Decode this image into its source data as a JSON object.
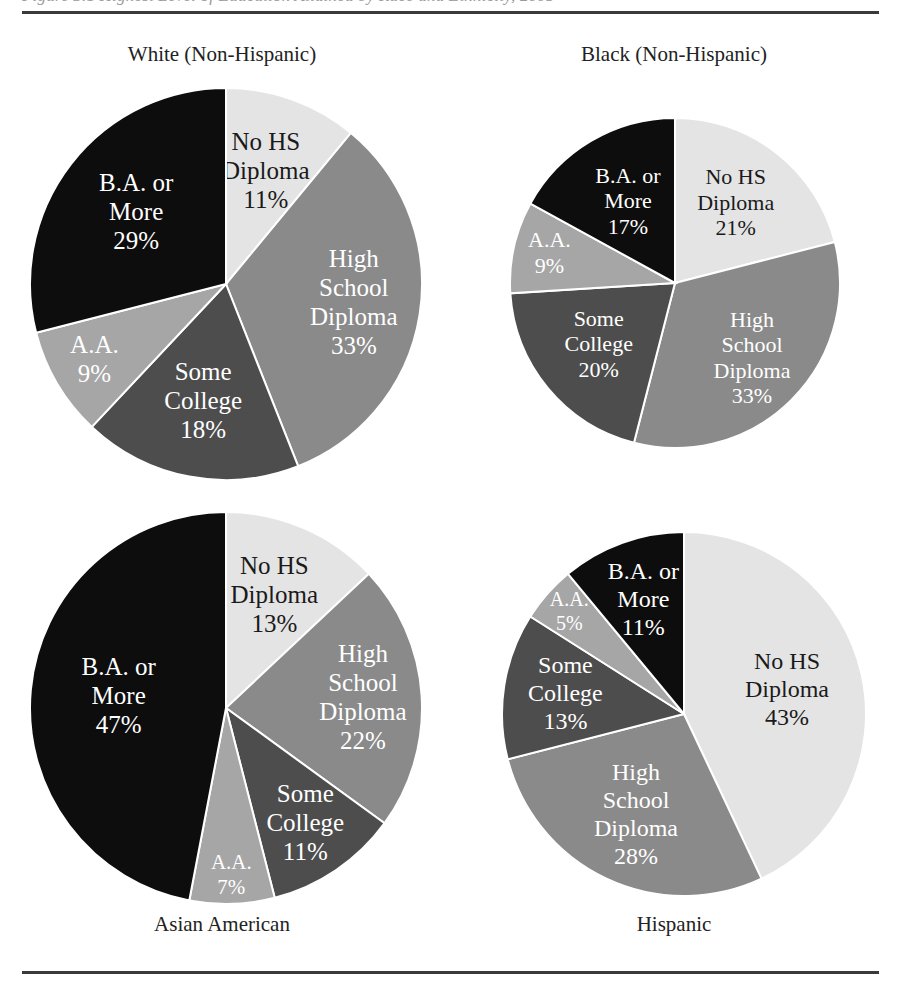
{
  "figure": {
    "clipped_caption": "Figure 3.1  Highest Level of Education Attained by Race and Ethnicity, 2005",
    "rules": {
      "top": true,
      "bottom": true
    }
  },
  "chart_data": {
    "type": "pie",
    "title": "",
    "legend_position": "in-slice",
    "categories": [
      "No HS Diploma",
      "High School Diploma",
      "Some College",
      "A.A.",
      "B.A. or More"
    ],
    "slice_colors": [
      "#e4e4e4",
      "#8a8a8a",
      "#4d4d4d",
      "#a6a6a6",
      "#0d0d0d"
    ],
    "slice_text_colors": [
      "#1a1a1a",
      "#ffffff",
      "#ffffff",
      "#ffffff",
      "#ffffff"
    ],
    "value_suffix": "%",
    "charts": [
      {
        "id": "white",
        "title": "White (Non-Hispanic)",
        "title_position": "above",
        "radius": 196,
        "values": [
          11,
          33,
          18,
          9,
          29
        ],
        "labels": [
          {
            "name": "No HS Diploma",
            "lines": [
              "No HS",
              "Diploma"
            ],
            "value": "11%"
          },
          {
            "name": "High School Diploma",
            "lines": [
              "High",
              "School",
              "Diploma"
            ],
            "value": "33%"
          },
          {
            "name": "Some College",
            "lines": [
              "Some",
              "College"
            ],
            "value": "18%"
          },
          {
            "name": "A.A.",
            "lines": [
              "A.A."
            ],
            "value": "9%"
          },
          {
            "name": "B.A. or More",
            "lines": [
              "B.A. or",
              "More"
            ],
            "value": "29%"
          }
        ]
      },
      {
        "id": "black",
        "title": "Black (Non-Hispanic)",
        "title_position": "above",
        "radius": 165,
        "values": [
          21,
          33,
          20,
          9,
          17
        ],
        "labels": [
          {
            "name": "No HS Diploma",
            "lines": [
              "No HS",
              "Diploma"
            ],
            "value": "21%"
          },
          {
            "name": "High School Diploma",
            "lines": [
              "High",
              "School",
              "Diploma"
            ],
            "value": "33%"
          },
          {
            "name": "Some College",
            "lines": [
              "Some",
              "College"
            ],
            "value": "20%"
          },
          {
            "name": "A.A.",
            "lines": [
              "A.A."
            ],
            "value": "9%"
          },
          {
            "name": "B.A. or More",
            "lines": [
              "B.A. or",
              "More"
            ],
            "value": "17%"
          }
        ]
      },
      {
        "id": "asian",
        "title": "Asian American",
        "title_position": "below",
        "radius": 196,
        "values": [
          13,
          22,
          11,
          7,
          47
        ],
        "labels": [
          {
            "name": "No HS Diploma",
            "lines": [
              "No HS",
              "Diploma"
            ],
            "value": "13%"
          },
          {
            "name": "High School Diploma",
            "lines": [
              "High",
              "School",
              "Diploma"
            ],
            "value": "22%"
          },
          {
            "name": "Some College",
            "lines": [
              "Some",
              "College"
            ],
            "value": "11%"
          },
          {
            "name": "A.A.",
            "lines": [
              "A.A."
            ],
            "value": "7%"
          },
          {
            "name": "B.A. or More",
            "lines": [
              "B.A. or",
              "More"
            ],
            "value": "47%"
          }
        ]
      },
      {
        "id": "hispanic",
        "title": "Hispanic",
        "title_position": "below",
        "radius": 182,
        "values": [
          43,
          28,
          13,
          5,
          11
        ],
        "labels": [
          {
            "name": "No HS Diploma",
            "lines": [
              "No HS",
              "Diploma"
            ],
            "value": "43%"
          },
          {
            "name": "High School Diploma",
            "lines": [
              "High",
              "School",
              "Diploma"
            ],
            "value": "28%"
          },
          {
            "name": "Some College",
            "lines": [
              "Some",
              "College"
            ],
            "value": "13%"
          },
          {
            "name": "A.A.",
            "lines": [
              "A.A."
            ],
            "value": "5%"
          },
          {
            "name": "B.A. or More",
            "lines": [
              "B.A. or",
              "More"
            ],
            "value": "11%"
          }
        ]
      }
    ]
  }
}
